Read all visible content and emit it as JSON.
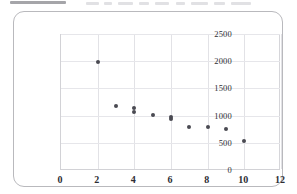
{
  "figure": {
    "border_color": "#b9b9bd",
    "background": "#ffffff"
  },
  "chart_data": {
    "type": "scatter",
    "title": "",
    "subtitle": "",
    "xlabel": "",
    "ylabel": "",
    "xlim": [
      0,
      12
    ],
    "ylim": [
      0,
      2500
    ],
    "xticks": [
      "0",
      "2",
      "4",
      "6",
      "8",
      "10",
      "12"
    ],
    "xtick_values": [
      0,
      2,
      4,
      6,
      8,
      10,
      12
    ],
    "yticks": [
      "0",
      "500",
      "1000",
      "1500",
      "2000",
      "2500"
    ],
    "ytick_values": [
      0,
      500,
      1000,
      1500,
      2000,
      2500
    ],
    "grid": true,
    "grid_axis": "both",
    "legend": null,
    "legend_position": "none",
    "marker": "circle",
    "marker_color": "#4a4a52",
    "marker_size": 4,
    "points": [
      {
        "x": 2,
        "y": 1980
      },
      {
        "x": 3,
        "y": 1180
      },
      {
        "x": 4,
        "y": 1135
      },
      {
        "x": 4,
        "y": 1075
      },
      {
        "x": 5,
        "y": 1020
      },
      {
        "x": 6,
        "y": 975
      },
      {
        "x": 6,
        "y": 930
      },
      {
        "x": 7,
        "y": 790
      },
      {
        "x": 8,
        "y": 785
      },
      {
        "x": 9,
        "y": 750
      },
      {
        "x": 10,
        "y": 535
      }
    ],
    "annotations": []
  },
  "top_artifact": {
    "description": "cut-off text line from page above",
    "smudges": [
      {
        "left": 10,
        "top": 1,
        "width": 56,
        "dark": true
      },
      {
        "left": 86,
        "top": 2,
        "width": 13,
        "dark": false
      },
      {
        "left": 104,
        "top": 2,
        "width": 8,
        "dark": false
      },
      {
        "left": 118,
        "top": 2,
        "width": 15,
        "dark": false
      },
      {
        "left": 139,
        "top": 2,
        "width": 10,
        "dark": false
      },
      {
        "left": 155,
        "top": 2,
        "width": 14,
        "dark": false
      },
      {
        "left": 176,
        "top": 2,
        "width": 9,
        "dark": false
      },
      {
        "left": 191,
        "top": 2,
        "width": 17,
        "dark": false
      },
      {
        "left": 214,
        "top": 2,
        "width": 11,
        "dark": false
      },
      {
        "left": 231,
        "top": 2,
        "width": 20,
        "dark": false
      }
    ]
  }
}
